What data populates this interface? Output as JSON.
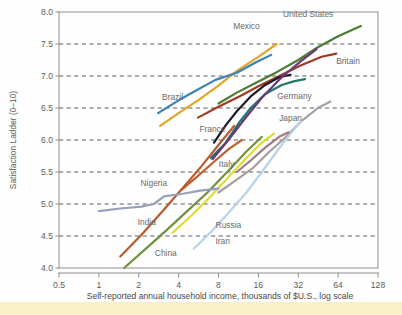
{
  "chart_data": {
    "type": "line",
    "title": "",
    "subtitle": "",
    "xlabel": "Self-reported annual household income, thousands of $U.S., log scale",
    "ylabel": "Satisfaction Ladder (0–10)",
    "xscale": "log",
    "xlim": [
      0.5,
      128
    ],
    "ylim": [
      4.0,
      8.0
    ],
    "xticks": [
      "0.5",
      "1",
      "2",
      "4",
      "8",
      "16",
      "32",
      "64",
      "128"
    ],
    "xtick_values": [
      0.5,
      1,
      2,
      4,
      8,
      16,
      32,
      64,
      128
    ],
    "yticks": [
      "4.0",
      "4.5",
      "5.0",
      "5.5",
      "6.0",
      "6.5",
      "7.0",
      "7.5",
      "8.0"
    ],
    "ytick_values": [
      4.0,
      4.5,
      5.0,
      5.5,
      6.0,
      6.5,
      7.0,
      7.5,
      8.0
    ],
    "grid": "horizontal-dashed",
    "legend": "inline-labels",
    "series": [
      {
        "name": "United States",
        "color": "#4a7c32",
        "label_x": 38,
        "label_y": 7.92,
        "points": [
          [
            8.0,
            6.57
          ],
          [
            11.0,
            6.74
          ],
          [
            15.5,
            6.9
          ],
          [
            22.0,
            7.06
          ],
          [
            32.0,
            7.25
          ],
          [
            45.0,
            7.45
          ],
          [
            64.0,
            7.62
          ],
          [
            95.0,
            7.78
          ]
        ]
      },
      {
        "name": "Britain",
        "color": "#9d3b23",
        "label_x": 76,
        "label_y": 7.18,
        "points": [
          [
            5.6,
            6.35
          ],
          [
            8.0,
            6.52
          ],
          [
            11.5,
            6.68
          ],
          [
            16.0,
            6.84
          ],
          [
            23.0,
            7.0
          ],
          [
            33.0,
            7.16
          ],
          [
            48.0,
            7.3
          ],
          [
            62.0,
            7.35
          ]
        ]
      },
      {
        "name": "Mexico",
        "color": "#e3a42a",
        "label_x": 13.0,
        "label_y": 7.73,
        "points": [
          [
            2.9,
            6.22
          ],
          [
            4.0,
            6.42
          ],
          [
            5.6,
            6.62
          ],
          [
            8.0,
            6.85
          ],
          [
            11.0,
            7.08
          ],
          [
            16.0,
            7.3
          ],
          [
            22.0,
            7.5
          ]
        ]
      },
      {
        "name": "Brazil",
        "color": "#3b82b8",
        "label_x": 3.6,
        "label_y": 6.62,
        "points": [
          [
            2.8,
            6.42
          ],
          [
            4.0,
            6.62
          ],
          [
            5.5,
            6.78
          ],
          [
            7.6,
            6.94
          ],
          [
            11.0,
            7.05
          ],
          [
            15.5,
            7.22
          ],
          [
            20.0,
            7.33
          ]
        ]
      },
      {
        "name": "Germany",
        "color": "#1f7a6e",
        "label_x": 30,
        "label_y": 6.64,
        "points": [
          [
            7.0,
            5.72
          ],
          [
            9.0,
            5.95
          ],
          [
            11.5,
            6.28
          ],
          [
            14.0,
            6.5
          ],
          [
            18.0,
            6.72
          ],
          [
            24.0,
            6.86
          ],
          [
            30.0,
            6.92
          ],
          [
            36.0,
            6.95
          ]
        ]
      },
      {
        "name": "France",
        "color": "#1c1c28",
        "label_x": 7.2,
        "label_y": 6.13,
        "points": [
          [
            7.4,
            5.96
          ],
          [
            9.0,
            6.22
          ],
          [
            11.0,
            6.45
          ],
          [
            14.0,
            6.68
          ],
          [
            18.0,
            6.86
          ],
          [
            23.0,
            6.98
          ],
          [
            28.0,
            7.02
          ]
        ]
      },
      {
        "name": "Japan",
        "color": "#a89f9a",
        "label_x": 28,
        "label_y": 6.3,
        "points": [
          [
            8.0,
            5.18
          ],
          [
            11.0,
            5.38
          ],
          [
            14.5,
            5.56
          ],
          [
            19.0,
            5.8
          ],
          [
            25.0,
            6.02
          ],
          [
            34.0,
            6.3
          ],
          [
            45.0,
            6.5
          ],
          [
            56.0,
            6.6
          ]
        ]
      },
      {
        "name": "Italy",
        "color": "#c06030",
        "label_x": 9.2,
        "label_y": 5.58,
        "points": [
          [
            4.2,
            5.22
          ],
          [
            5.6,
            5.44
          ],
          [
            7.4,
            5.66
          ],
          [
            9.6,
            5.86
          ],
          [
            12.0,
            6.0
          ]
        ]
      },
      {
        "name": "Russia",
        "color": "#e0dc2e",
        "label_x": 9.5,
        "label_y": 4.63,
        "points": [
          [
            3.6,
            4.55
          ],
          [
            5.0,
            4.82
          ],
          [
            7.0,
            5.12
          ],
          [
            9.5,
            5.42
          ],
          [
            13.0,
            5.72
          ],
          [
            17.0,
            5.96
          ],
          [
            21.0,
            6.1
          ]
        ]
      },
      {
        "name": "Iran",
        "color": "#b8d4e8",
        "label_x": 8.6,
        "label_y": 4.38,
        "points": [
          [
            5.2,
            4.3
          ],
          [
            7.0,
            4.56
          ],
          [
            9.5,
            4.86
          ],
          [
            13.0,
            5.18
          ],
          [
            17.0,
            5.5
          ],
          [
            22.0,
            5.82
          ],
          [
            28.0,
            6.1
          ],
          [
            34.0,
            6.3
          ]
        ]
      },
      {
        "name": "China",
        "color": "#6f9140",
        "label_x": 3.2,
        "label_y": 4.18,
        "points": [
          [
            1.55,
            4.0
          ],
          [
            2.2,
            4.28
          ],
          [
            3.2,
            4.58
          ],
          [
            4.6,
            4.88
          ],
          [
            6.6,
            5.18
          ],
          [
            9.5,
            5.52
          ],
          [
            13.0,
            5.82
          ],
          [
            17.0,
            6.05
          ]
        ]
      },
      {
        "name": "India",
        "color": "#b85a2e",
        "label_x": 2.3,
        "label_y": 4.67,
        "points": [
          [
            1.45,
            4.18
          ],
          [
            2.1,
            4.52
          ],
          [
            3.0,
            4.88
          ],
          [
            4.3,
            5.25
          ],
          [
            6.0,
            5.6
          ],
          [
            8.2,
            5.95
          ],
          [
            10.5,
            6.22
          ]
        ]
      },
      {
        "name": "Nigeria",
        "color": "#97a0bd",
        "label_x": 2.6,
        "label_y": 5.28,
        "points": [
          [
            1.0,
            4.89
          ],
          [
            1.45,
            4.93
          ],
          [
            2.1,
            4.96
          ],
          [
            2.6,
            5.0
          ],
          [
            3.1,
            5.12
          ],
          [
            4.3,
            5.16
          ],
          [
            5.8,
            5.21
          ],
          [
            8.0,
            5.24
          ]
        ]
      },
      {
        "name": "unnamed-purple",
        "color": "#6a3a78",
        "label_x": null,
        "label_y": null,
        "points": [
          [
            7.2,
            5.7
          ],
          [
            9.5,
            6.0
          ],
          [
            12.5,
            6.32
          ],
          [
            17.0,
            6.66
          ],
          [
            24.0,
            6.98
          ],
          [
            33.0,
            7.22
          ],
          [
            44.0,
            7.42
          ]
        ]
      },
      {
        "name": "unnamed-mauve",
        "color": "#a07a84",
        "label_x": null,
        "label_y": null,
        "points": [
          [
            11.0,
            5.5
          ],
          [
            14.0,
            5.68
          ],
          [
            18.0,
            5.88
          ],
          [
            23.0,
            6.05
          ],
          [
            27.0,
            6.12
          ]
        ]
      }
    ]
  },
  "figure": {
    "background": "#fefefe",
    "band_color": "#faf0c8",
    "frame_color": "#8d8d8d",
    "grid_color": "#4d4d4d",
    "text_color": "#5b5b5b"
  }
}
